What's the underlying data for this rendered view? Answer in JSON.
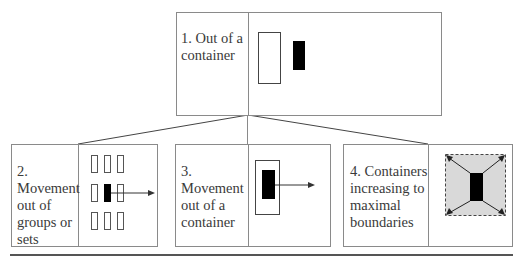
{
  "diagram": {
    "top_box": {
      "label": "1. Out of a container"
    },
    "bottom_boxes": [
      {
        "label": "2. Movement out of groups or sets"
      },
      {
        "label": "3. Movement out of a container"
      },
      {
        "label": "4. Containers increasing to maximal boundaries"
      }
    ],
    "colors": {
      "border": "#8a8a8a",
      "fill_black": "#000000",
      "shaded_area": "#d9d9d9",
      "rule": "#555555"
    }
  }
}
